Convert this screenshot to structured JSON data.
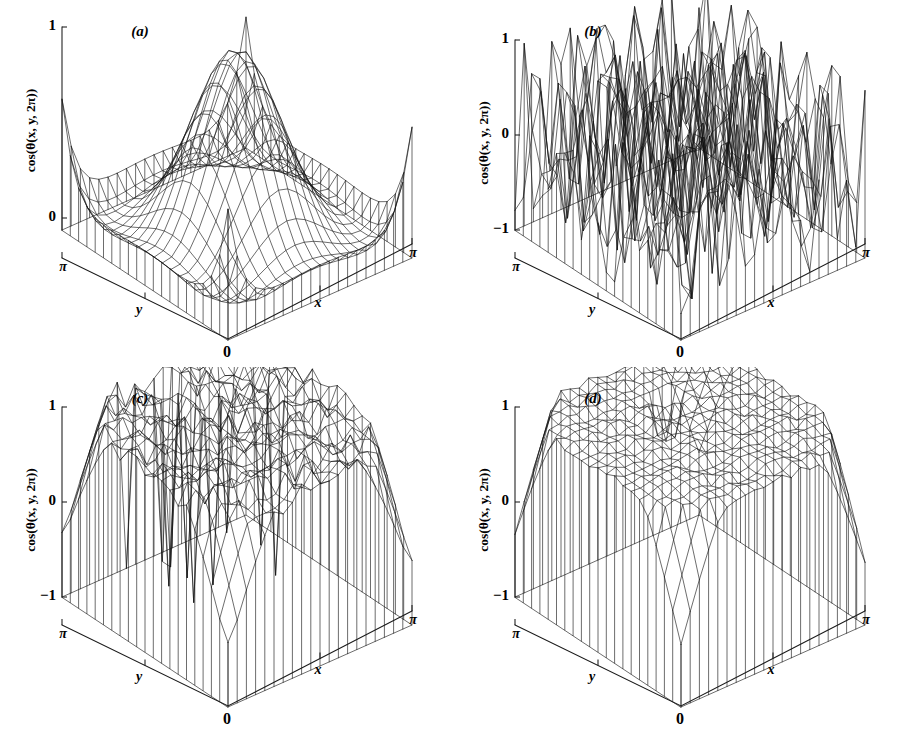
{
  "figure": {
    "background_color": "#ffffff",
    "line_color": "#121212",
    "panel_count": 4,
    "layout": "2x2 grid of 3D wireframe surface plots"
  },
  "panels": [
    {
      "tag": "(a)",
      "zlabel": "cos(θ(x, y, 2π))",
      "xlabel": "x",
      "ylabel": "y",
      "origin_label": "0",
      "x_end_label": "π",
      "y_end_label": "π",
      "z_ticks": [
        "1",
        "0"
      ],
      "z_tick_values": [
        1,
        0
      ],
      "zmin": 0,
      "zmax": 1
    },
    {
      "tag": "(b)",
      "zlabel": "cos(θ(x, y, 2π))",
      "xlabel": "x",
      "ylabel": "y",
      "origin_label": "0",
      "x_end_label": "π",
      "y_end_label": "π",
      "z_ticks": [
        "1",
        "0",
        "−1"
      ],
      "z_tick_values": [
        1,
        0,
        -1
      ],
      "zmin": -1,
      "zmax": 1
    },
    {
      "tag": "(c)",
      "zlabel": "cos(θ(x, y, 2π))",
      "xlabel": "x",
      "ylabel": "y",
      "origin_label": "0",
      "x_end_label": "π",
      "y_end_label": "π",
      "z_ticks": [
        "1",
        "0",
        "−1"
      ],
      "z_tick_values": [
        1,
        0,
        -1
      ],
      "zmin": -1,
      "zmax": 1
    },
    {
      "tag": "(d)",
      "zlabel": "cos(θ(x, y, 2π))",
      "xlabel": "x",
      "ylabel": "y",
      "origin_label": "0",
      "x_end_label": "π",
      "y_end_label": "π",
      "z_ticks": [
        "1",
        "0",
        "−1"
      ],
      "z_tick_values": [
        1,
        0,
        -1
      ],
      "zmin": -1,
      "zmax": 1
    }
  ],
  "chart_data": [
    {
      "type": "surface",
      "panel": "(a)",
      "title": "(a)",
      "xlabel": "x",
      "ylabel": "y",
      "zlabel": "cos(θ(x, y, 2π))",
      "xlim": [
        0,
        3.14159
      ],
      "ylim": [
        0,
        3.14159
      ],
      "zlim": [
        0,
        1
      ],
      "ztick_labels": [
        "0",
        "1"
      ],
      "xtick_labels": [
        "0",
        "π"
      ],
      "ytick_labels": [
        "0",
        "π"
      ],
      "grid_n": 21,
      "description": "Smooth single central peak reaching 1 at the domain centre, decaying to a low flat basin with small upturns at the four corners.",
      "model": "peak",
      "params": {
        "amp": 1.0,
        "width": 0.62,
        "corner": 0.4,
        "floor": 0.02
      },
      "legend": "none"
    },
    {
      "type": "surface",
      "panel": "(b)",
      "title": "(b)",
      "xlabel": "x",
      "ylabel": "y",
      "zlabel": "cos(θ(x, y, 2π))",
      "xlim": [
        0,
        3.14159
      ],
      "ylim": [
        0,
        3.14159
      ],
      "zlim": [
        -1,
        1
      ],
      "ztick_labels": [
        "−1",
        "0",
        "1"
      ],
      "xtick_labels": [
        "0",
        "π"
      ],
      "ytick_labels": [
        "0",
        "π"
      ],
      "grid_n": 21,
      "description": "Fully random, uncorrelated surface oscillating over the whole range −1 to 1, strongly spiky everywhere.",
      "model": "noise",
      "params": {
        "amp": 1.0,
        "seed": 1721,
        "bias": 0.12
      },
      "legend": "none"
    },
    {
      "type": "surface",
      "panel": "(c)",
      "title": "(c)",
      "xlabel": "x",
      "ylabel": "y",
      "zlabel": "cos(θ(x, y, 2π))",
      "xlim": [
        0,
        3.14159
      ],
      "ylim": [
        0,
        3.14159
      ],
      "zlim": [
        -1,
        1
      ],
      "ztick_labels": [
        "−1",
        "0",
        "1"
      ],
      "xtick_labels": [
        "0",
        "π"
      ],
      "ytick_labels": [
        "0",
        "π"
      ],
      "grid_n": 21,
      "description": "Broad plateau near 1 across most of the domain with a slightly rough top, bounded by steep walls, plus several narrow downward spikes reaching −1 near the front-right region.",
      "model": "plateau_spikes",
      "params": {
        "plateau": 0.9,
        "radius": 0.78,
        "roughness": 0.055,
        "spike_depth": -1.0,
        "seed": 907
      },
      "legend": "none"
    },
    {
      "type": "surface",
      "panel": "(d)",
      "title": "(d)",
      "xlabel": "x",
      "ylabel": "y",
      "zlabel": "cos(θ(x, y, 2π))",
      "xlim": [
        0,
        3.14159
      ],
      "ylim": [
        0,
        3.14159
      ],
      "zlim": [
        -1,
        1
      ],
      "ztick_labels": [
        "−1",
        "0",
        "1"
      ],
      "xtick_labels": [
        "0",
        "π"
      ],
      "ytick_labels": [
        "0",
        "π"
      ],
      "grid_n": 21,
      "description": "Clean broad plateau near 1 with a fine regular mesh top and steep smooth walls dropping to the base; only one shallow dip near the front.",
      "model": "plateau_smooth",
      "params": {
        "plateau": 0.93,
        "radius": 0.8,
        "roughness": 0.022,
        "seed": 333
      },
      "legend": "none"
    }
  ]
}
